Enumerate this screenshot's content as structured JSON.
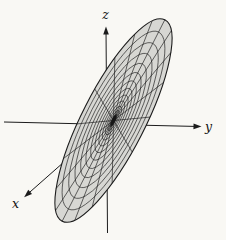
{
  "figure": {
    "axis_labels": {
      "x": "x",
      "y": "y",
      "z": "z"
    },
    "colors": {
      "paper": "#f9f8f4",
      "disk_fill": "#d7d7d3",
      "mesh_line": "#1c1c1c",
      "axis_line": "#1c1c1c",
      "label": "#111111",
      "center_blob": "#161616"
    },
    "mesh": {
      "center": {
        "x": 113.5,
        "y": 120.5
      },
      "semi_major": 113,
      "semi_minor": 31.5,
      "rotation_deg": -63,
      "ring_count": 16,
      "ring_spacing_power": 2,
      "spoke_count": 18
    },
    "axes": {
      "y_axis": {
        "x1": 4,
        "y1": 122,
        "x2": 199,
        "y2": 126.5
      },
      "z_axis": {
        "x1": 107.5,
        "y1": 233,
        "x2": 106,
        "y2": 29
      },
      "x_axis": {
        "x1": 162,
        "y1": 75.5,
        "x2": 26,
        "y2": 195.5
      }
    },
    "label_positions": {
      "z": {
        "x": 105.5,
        "y": 19,
        "anchor": "middle"
      },
      "y": {
        "x": 205,
        "y": 131,
        "anchor": "start"
      },
      "x": {
        "x": 12,
        "y": 208,
        "anchor": "start"
      }
    }
  }
}
